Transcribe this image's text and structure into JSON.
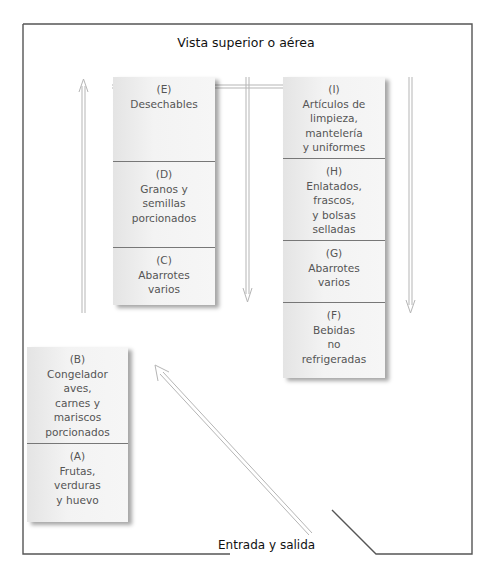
{
  "diagram": {
    "title": "Vista superior o aérea",
    "entrance_label": "Entrada y salida",
    "colors": {
      "frame": "#555555",
      "arrow": "#bbbbbb",
      "shelf": "#f0f0f0",
      "divider": "#777777",
      "text": "#555555"
    },
    "shelves": [
      {
        "id": "shelf-center-left",
        "sections": [
          {
            "letter": "(E)",
            "lines": [
              "Desechables"
            ]
          },
          {
            "letter": "(D)",
            "lines": [
              "Granos y",
              "semillas",
              "porcionados"
            ]
          },
          {
            "letter": "(C)",
            "lines": [
              "Abarrotes",
              "varios"
            ]
          }
        ]
      },
      {
        "id": "shelf-center-right",
        "sections": [
          {
            "letter": "(I)",
            "lines": [
              "Artículos de",
              "limpieza,",
              "mantelería",
              "y uniformes"
            ]
          },
          {
            "letter": "(H)",
            "lines": [
              "Enlatados,",
              "frascos,",
              "y bolsas",
              "selladas"
            ]
          },
          {
            "letter": "(G)",
            "lines": [
              "Abarrotes",
              "varios"
            ]
          },
          {
            "letter": "(F)",
            "lines": [
              "Bebidas",
              "no",
              "refrigeradas"
            ]
          }
        ]
      },
      {
        "id": "shelf-bottom-left",
        "sections": [
          {
            "letter": "(B)",
            "lines": [
              "Congelador",
              "aves,",
              "carnes y",
              "mariscos",
              "porcionados"
            ]
          },
          {
            "letter": "(A)",
            "lines": [
              "Frutas,",
              "verduras",
              "y huevo"
            ]
          }
        ]
      }
    ]
  }
}
